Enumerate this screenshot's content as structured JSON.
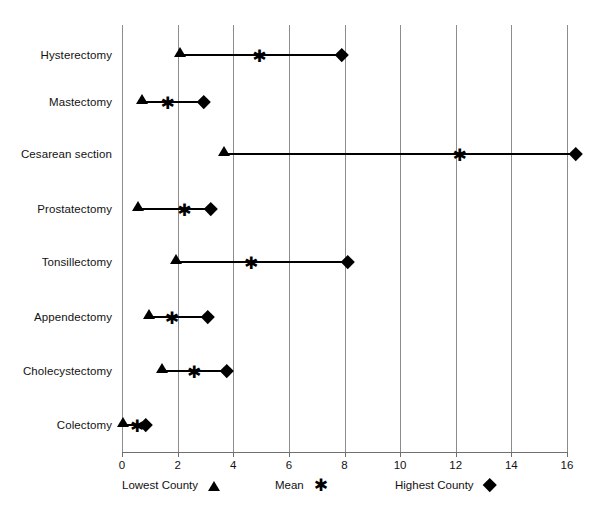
{
  "chart_data": {
    "type": "range-dot",
    "title": "",
    "xlabel": "",
    "ylabel": "",
    "xlim": [
      0,
      16
    ],
    "xticks": [
      0,
      2,
      4,
      6,
      8,
      10,
      12,
      14,
      16
    ],
    "xtick_labels": [
      "0",
      "2",
      "4",
      "6",
      "8",
      "10",
      "12",
      "14",
      "16"
    ],
    "grid": "vertical",
    "legend_position": "below-axis",
    "categories": [
      "Hysterectomy",
      "Mastectomy",
      "Cesarean section",
      "Prostatectomy",
      "Tonsillectomy",
      "Appendectomy",
      "Cholecystectomy",
      "Colectomy"
    ],
    "series": [
      {
        "name": "Lowest County",
        "marker": "triangle",
        "values": [
          2.1,
          0.75,
          3.7,
          0.6,
          1.95,
          1.0,
          1.45,
          0.05
        ]
      },
      {
        "name": "Mean",
        "marker": "asterisk",
        "values": [
          4.9,
          1.6,
          12.1,
          2.2,
          4.6,
          1.75,
          2.55,
          0.5
        ]
      },
      {
        "name": "Highest County",
        "marker": "diamond",
        "values": [
          7.9,
          2.95,
          16.3,
          3.2,
          8.1,
          3.1,
          3.75,
          0.85
        ]
      }
    ]
  },
  "legend": {
    "items": [
      {
        "label": "Lowest County",
        "symbol": "triangle-icon"
      },
      {
        "label": "Mean",
        "symbol": "asterisk-icon"
      },
      {
        "label": "Highest  County",
        "symbol": "diamond-icon"
      }
    ]
  },
  "caption": {
    "cut_off_line": ""
  },
  "colors": {
    "marker": "#000000",
    "gridline": "#8d8d8d",
    "axis": "#6e6e6e",
    "text": "#121212"
  }
}
